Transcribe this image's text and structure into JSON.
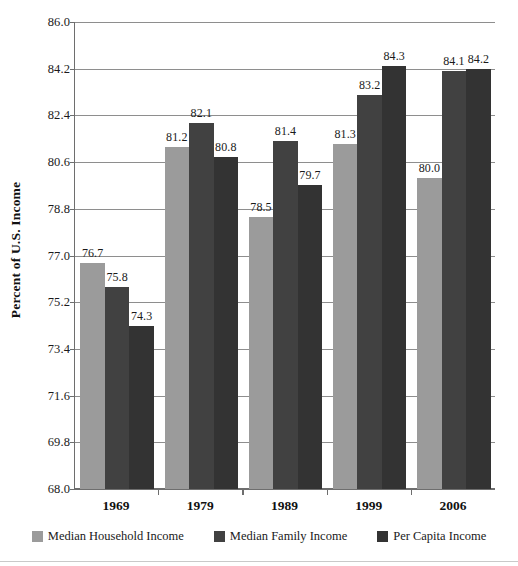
{
  "chart_data": {
    "type": "bar",
    "title": "",
    "xlabel": "",
    "ylabel": "Percent of U.S. Income",
    "categories": [
      "1969",
      "1979",
      "1989",
      "1999",
      "2006"
    ],
    "ylim": [
      68.0,
      86.0
    ],
    "yticks": [
      "68.0",
      "69.8",
      "71.6",
      "73.4",
      "75.2",
      "77.0",
      "78.8",
      "80.6",
      "82.4",
      "84.2",
      "86.0"
    ],
    "grid": true,
    "legend_position": "bottom",
    "series": [
      {
        "name": "Median Household Income",
        "color": "#9b9b9b",
        "values": [
          76.7,
          81.2,
          78.5,
          81.3,
          80.0
        ],
        "labels": [
          "76.7",
          "81.2",
          "78.5",
          "81.3",
          "80.0"
        ]
      },
      {
        "name": "Median Family Income",
        "color": "#414141",
        "values": [
          75.8,
          82.1,
          81.4,
          83.2,
          84.1
        ],
        "labels": [
          "75.8",
          "82.1",
          "81.4",
          "83.2",
          "84.1"
        ]
      },
      {
        "name": "Per Capita Income",
        "color": "#333333",
        "values": [
          74.3,
          80.8,
          79.7,
          84.3,
          84.2
        ],
        "labels": [
          "74.3",
          "80.8",
          "79.7",
          "84.3",
          "84.2"
        ]
      }
    ]
  },
  "colors": {
    "series1": "#9b9b9b",
    "series2": "#414141",
    "series3": "#333333",
    "gridline": "#8e8e8e",
    "axis": "#6e6e6e",
    "text": "#1a1a1a"
  }
}
